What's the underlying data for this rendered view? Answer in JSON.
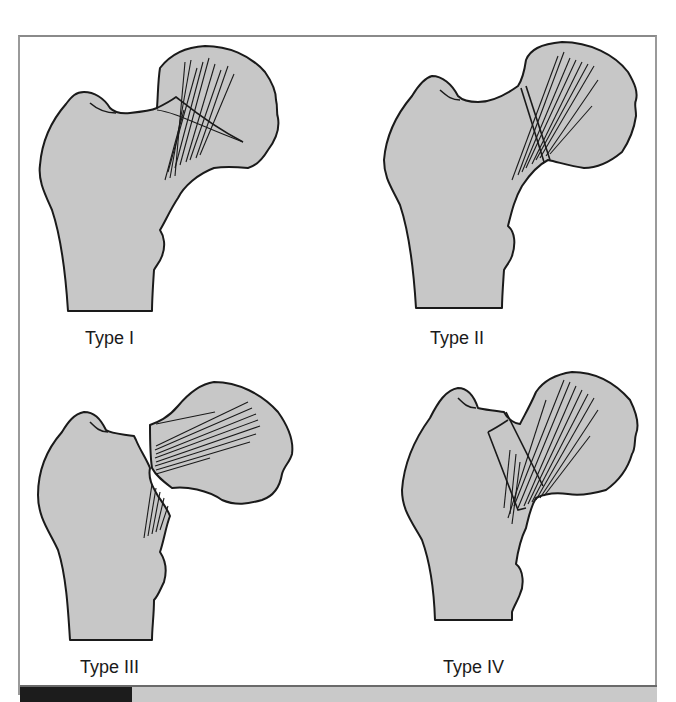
{
  "figure": {
    "title": "",
    "panels": [
      {
        "id": "type-1",
        "label": "Type I"
      },
      {
        "id": "type-2",
        "label": "Type II"
      },
      {
        "id": "type-3",
        "label": "Type III"
      },
      {
        "id": "type-4",
        "label": "Type IV"
      }
    ]
  },
  "colors": {
    "bone_fill": "#c7c7c7",
    "outline": "#1a1a1a",
    "frame": "#9a9a9a",
    "bottom_bar": "#c9c9c9",
    "bottom_bar_accent": "#1c1c1c"
  }
}
